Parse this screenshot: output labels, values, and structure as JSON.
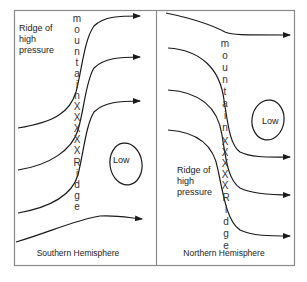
{
  "diagram": {
    "panels": [
      {
        "id": "southern",
        "caption": "Southern Hemisphere",
        "ridge_label": [
          "Ridge of",
          "high",
          "pressure"
        ],
        "low_label": "Low",
        "mountain_letters": [
          "m",
          "o",
          "u",
          "n",
          "t",
          "a",
          "i",
          "n",
          "X",
          "X",
          "X",
          "X",
          "X",
          "R",
          "i",
          "d",
          "g",
          "e"
        ]
      },
      {
        "id": "northern",
        "caption": "Northern Hemisphere",
        "ridge_label": [
          "Ridge of",
          "high",
          "pressure"
        ],
        "low_label": "Low",
        "mountain_letters": [
          "m",
          "o",
          "u",
          "n",
          "t",
          "a",
          "i",
          "n",
          "X",
          "X",
          "X",
          "X",
          "X",
          "R",
          "i",
          "d",
          "g",
          "e"
        ]
      }
    ],
    "colors": {
      "line": "#1a1a1a",
      "frame": "#8a8a8a",
      "text": "#222222"
    }
  }
}
